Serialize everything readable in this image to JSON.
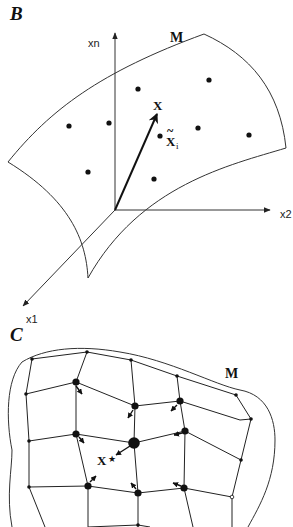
{
  "panels": {
    "b": {
      "label": "B",
      "manifold_label": "M",
      "axes": {
        "vertical": "xn",
        "horizontal": "x2",
        "depth": "x1"
      },
      "vector_label": "X",
      "sample_label_main": "X",
      "sample_label_sub": "i",
      "sample_label_accent": "~"
    },
    "c": {
      "label": "C",
      "manifold_label": "M",
      "target_label": "X",
      "target_star": "★"
    }
  },
  "colors": {
    "ink": "#111111",
    "background": "#ffffff"
  }
}
